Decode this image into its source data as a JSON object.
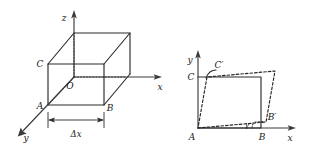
{
  "figure": {
    "kind": "two-panel mechanics diagram",
    "background_color": "#ffffff",
    "line_color": "#2b2b2b",
    "label_color": "#1a1a1a"
  },
  "panel_left": {
    "name": "cube-element-3d",
    "axes": {
      "z_label": "z",
      "x_label": "x",
      "y_label": "y"
    },
    "vertices": {
      "origin_label": "O",
      "a_label": "A",
      "b_label": "B",
      "c_label": "C"
    },
    "dimension": {
      "label": "Δx"
    }
  },
  "panel_right": {
    "name": "shear-deformation-2d",
    "axes": {
      "y_label": "y",
      "x_label": "x"
    },
    "vertices": {
      "a_label": "A",
      "b_label": "B",
      "c_label": "C",
      "c_prime_label": "C′",
      "b_prime_label": "B′"
    },
    "angle": {
      "gamma_label": "γ"
    }
  }
}
